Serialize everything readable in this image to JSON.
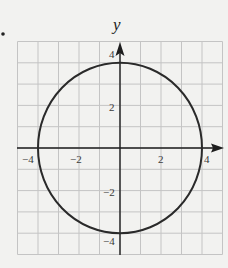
{
  "bullet": "•",
  "chart_data": {
    "type": "line",
    "title": "",
    "xlabel": "",
    "ylabel": "y",
    "xlim": [
      -5,
      5
    ],
    "ylim": [
      -5,
      5
    ],
    "grid": true,
    "grid_step": 1,
    "x_ticks": [
      -4,
      -2,
      2,
      4
    ],
    "y_ticks": [
      4,
      2,
      -2,
      -4
    ],
    "x_tick_labels": [
      "−4",
      "−2",
      "2",
      "4"
    ],
    "y_tick_labels": [
      "4",
      "2",
      "−2",
      "−4"
    ],
    "series": [
      {
        "name": "circle",
        "shape": "circle",
        "center": [
          0,
          0
        ],
        "radius": 4,
        "equation": "x^2 + y^2 = 16"
      }
    ],
    "colors": {
      "grid": "#c4c4c4",
      "axis": "#1e1e1e",
      "curve": "#2a2a2a",
      "background": "#f2f2f0"
    }
  }
}
